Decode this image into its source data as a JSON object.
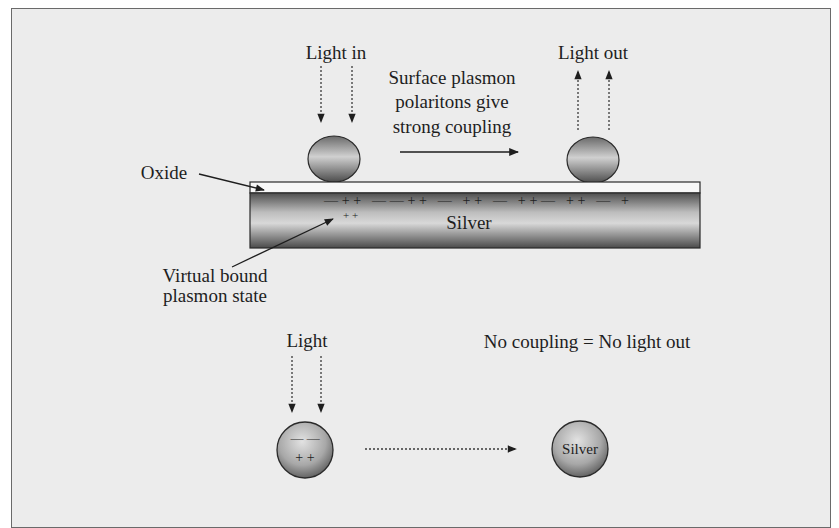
{
  "figure": {
    "top_panel": {
      "light_in_label": "Light in",
      "light_out_label": "Light out",
      "coupling_caption": {
        "line1": "Surface plasmon",
        "line2": "polaritons give",
        "line3": "strong coupling"
      },
      "oxide_label": "Oxide",
      "silver_label": "Silver",
      "surface_charges": "—++ ——++ — ++ — ++— ++ — +",
      "bound_charges": "+ +",
      "virtual_state_label": {
        "line1": "Virtual bound",
        "line2": "plasmon state"
      }
    },
    "bottom_panel": {
      "light_label": "Light",
      "no_coupling_label": "No coupling = No light out",
      "particle_charges_top": "— —",
      "particle_charges_bottom": "+ +",
      "silver_particle_label": "Silver"
    },
    "colors": {
      "background": "#ececec",
      "frame_border": "#6a6a6a",
      "ink": "#1e1e1e",
      "metal_light": "#d6d6d6",
      "metal_dark": "#5a5a5a",
      "oxide": "#f7f7f7"
    }
  }
}
